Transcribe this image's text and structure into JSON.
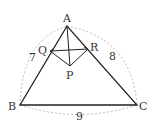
{
  "diagram": {
    "points": {
      "A": {
        "label": "A",
        "x": 67,
        "y": 26
      },
      "B": {
        "label": "B",
        "x": 20,
        "y": 105
      },
      "C": {
        "label": "C",
        "x": 137,
        "y": 105
      },
      "Q": {
        "label": "Q",
        "x": 50,
        "y": 51
      },
      "R": {
        "label": "R",
        "x": 88,
        "y": 49
      },
      "P": {
        "label": "P",
        "x": 70,
        "y": 66
      }
    },
    "side_lengths": {
      "AB": "7",
      "AC": "8",
      "BC": "9"
    },
    "colors": {
      "line": "#222222",
      "dashed_arc": "#aaaaaa",
      "text": "#333333"
    }
  }
}
